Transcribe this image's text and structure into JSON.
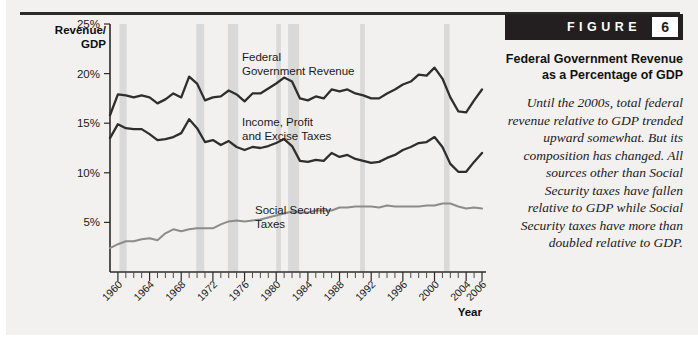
{
  "figure": {
    "badge_word": "FIGURE",
    "badge_number": "6",
    "title": "Federal Government Revenue as a Percentage of GDP",
    "caption": "Until the 2000s, total federal revenue relative to GDP trended upward somewhat. But its composition has changed. All sources other than Social Security taxes have fallen relative to GDP while Social Security taxes have more than doubled relative to GDP."
  },
  "chart_data": {
    "type": "line",
    "title": "Federal Government Revenue as a Percentage of GDP",
    "xlabel": "Year",
    "ylabel": "Revenue/ GDP",
    "xlim": [
      1959,
      2006
    ],
    "ylim": [
      0,
      25
    ],
    "grid": false,
    "legend_position": "inline-annotations",
    "ytick_labels": [
      "25%",
      "20%",
      "15%",
      "10%",
      "5%"
    ],
    "ytick_values": [
      25,
      20,
      15,
      10,
      5
    ],
    "xtick_labels": [
      "1960",
      "1964",
      "1968",
      "1972",
      "1976",
      "1980",
      "1984",
      "1988",
      "1992",
      "1996",
      "2000",
      "2004",
      "2006"
    ],
    "xtick_values": [
      1960,
      1964,
      1968,
      1972,
      1976,
      1980,
      1984,
      1988,
      1992,
      1996,
      2000,
      2004,
      2006
    ],
    "x": [
      1959,
      1960,
      1961,
      1962,
      1963,
      1964,
      1965,
      1966,
      1967,
      1968,
      1969,
      1970,
      1971,
      1972,
      1973,
      1974,
      1975,
      1976,
      1977,
      1978,
      1979,
      1980,
      1981,
      1982,
      1983,
      1984,
      1985,
      1986,
      1987,
      1988,
      1989,
      1990,
      1991,
      1992,
      1993,
      1994,
      1995,
      1996,
      1997,
      1998,
      1999,
      2000,
      2001,
      2002,
      2003,
      2004,
      2005,
      2006
    ],
    "series": [
      {
        "name": "Federal Government Revenue",
        "color": "#2e2e2e",
        "label_text": "Federal Government Revenue",
        "values": [
          15.8,
          17.9,
          17.8,
          17.6,
          17.8,
          17.6,
          17.0,
          17.4,
          18.0,
          17.6,
          19.7,
          19.0,
          17.3,
          17.6,
          17.7,
          18.3,
          17.9,
          17.2,
          18.0,
          18.0,
          18.5,
          19.0,
          19.6,
          19.2,
          17.5,
          17.3,
          17.7,
          17.5,
          18.4,
          18.2,
          18.4,
          18.0,
          17.8,
          17.5,
          17.5,
          18.0,
          18.4,
          18.9,
          19.2,
          19.9,
          19.8,
          20.6,
          19.5,
          17.6,
          16.2,
          16.1,
          17.3,
          18.4
        ]
      },
      {
        "name": "Income, Profit and Excise Taxes",
        "color": "#2e2e2e",
        "label_text": "Income, Profit and Excise Taxes",
        "values": [
          13.5,
          14.9,
          14.5,
          14.4,
          14.4,
          13.9,
          13.3,
          13.4,
          13.6,
          14.0,
          15.4,
          14.5,
          13.1,
          13.3,
          12.8,
          13.2,
          12.6,
          12.3,
          12.6,
          12.5,
          12.7,
          13.0,
          13.4,
          12.7,
          11.2,
          11.1,
          11.3,
          11.2,
          12.0,
          11.6,
          11.8,
          11.4,
          11.2,
          11.0,
          11.1,
          11.5,
          11.8,
          12.3,
          12.6,
          13.0,
          13.1,
          13.6,
          12.6,
          10.9,
          10.1,
          10.1,
          11.1,
          12.0
        ]
      },
      {
        "name": "Social Security Taxes",
        "color": "#8c8c8c",
        "label_text": "Social Security Taxes",
        "values": [
          2.4,
          2.8,
          3.1,
          3.1,
          3.3,
          3.4,
          3.2,
          3.9,
          4.3,
          4.1,
          4.3,
          4.4,
          4.4,
          4.4,
          4.8,
          5.1,
          5.2,
          5.1,
          5.2,
          5.3,
          5.5,
          5.7,
          5.9,
          6.1,
          6.0,
          6.0,
          6.2,
          6.2,
          6.2,
          6.5,
          6.5,
          6.6,
          6.6,
          6.6,
          6.5,
          6.7,
          6.6,
          6.6,
          6.6,
          6.6,
          6.7,
          6.7,
          6.9,
          6.9,
          6.6,
          6.4,
          6.5,
          6.4
        ]
      }
    ],
    "recession_bands": [
      [
        1960.2,
        1961.1
      ],
      [
        1969.9,
        1970.9
      ],
      [
        1973.9,
        1975.2
      ],
      [
        1980.0,
        1980.6
      ],
      [
        1981.5,
        1982.9
      ],
      [
        1990.6,
        1991.2
      ],
      [
        2001.2,
        2001.9
      ]
    ]
  }
}
